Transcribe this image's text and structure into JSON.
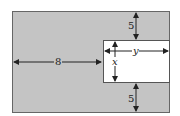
{
  "diagram": {
    "colors": {
      "outer_fill": "#c4c4c4",
      "inner_fill": "#ffffff",
      "stroke": "#555555",
      "arrow": "#222222"
    },
    "labels": {
      "top_gap": "5",
      "bottom_gap": "5",
      "left_width": "8",
      "inner_height": "x",
      "inner_width": "y"
    }
  }
}
